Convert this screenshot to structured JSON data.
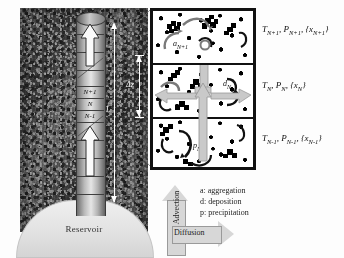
{
  "figure": {
    "domain_note": "scientific diagram"
  },
  "formation": {
    "reservoir_label": "Reservoir"
  },
  "wellbore": {
    "cell_labels": [
      "N+1",
      "N",
      "N-1"
    ],
    "dimension_length": "L",
    "dimension_cell_height": "Δz"
  },
  "cells_panel": {
    "cells": [
      {
        "id": "cell-n-plus-1",
        "state_label": "T",
        "state_sub1": "N+1",
        "state_label2": "P",
        "state_sub2": "N+1",
        "state_label3": "{x",
        "state_sub3": "N+1",
        "state_label4": "}",
        "full_state": "T(N+1), P(N+1), {x(N+1)}",
        "process_symbol": "a",
        "process_sub": "N+1"
      },
      {
        "id": "cell-n",
        "state_label": "T",
        "state_sub1": "N",
        "state_label2": "P",
        "state_sub2": "N",
        "state_label3": "{x",
        "state_sub3": "N",
        "state_label4": "}",
        "full_state": "T(N), P(N), {x(N)}",
        "process_symbol": "d",
        "process_sub": "N"
      },
      {
        "id": "cell-n-minus-1",
        "state_label": "T",
        "state_sub1": "N-1",
        "state_label2": "P",
        "state_sub2": "N-1",
        "state_label3": "{x",
        "state_sub3": "N-1",
        "state_label4": "}",
        "full_state": "T(N-1), P(N-1), {x(N-1)}",
        "process_symbol": "p",
        "process_sub": "N-1"
      }
    ]
  },
  "legend": {
    "items": [
      "a: aggregation",
      "d: deposition",
      "p: precipitation"
    ]
  },
  "transport_arrows": {
    "advection": "Advection",
    "diffusion": "Diffusion"
  },
  "colors": {
    "rock_dark": "#3a3a3a",
    "well_metal": "#c9c9c9",
    "cell_border": "#111111",
    "gray_arrow": "#c9c9c9",
    "reservoir_dome": "#e6e6e6",
    "legend_text": "#222222"
  }
}
